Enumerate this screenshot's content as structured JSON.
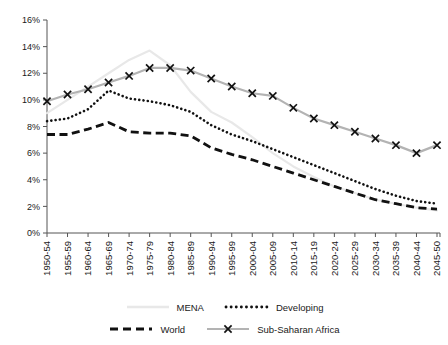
{
  "chart_data": {
    "type": "line",
    "title": "",
    "xlabel": "",
    "ylabel": "",
    "ylim": [
      0,
      16
    ],
    "ytick_step": 2,
    "ytick_labels": [
      "0%",
      "2%",
      "4%",
      "6%",
      "8%",
      "10%",
      "12%",
      "14%",
      "16%"
    ],
    "grid": false,
    "legend_position": "bottom",
    "categories": [
      "1950-54",
      "1955-59",
      "1960-64",
      "1965-69",
      "1970-74",
      "1975-79",
      "1980-84",
      "1985-89",
      "1990-94",
      "1995-99",
      "2000-04",
      "2005-09",
      "2010-14",
      "2015-19",
      "2020-24",
      "2025-29",
      "2030-34",
      "2035-39",
      "2040-44",
      "2045-50"
    ],
    "series": [
      {
        "name": "MENA",
        "style": "solid-light",
        "color": "#e8e8e8",
        "values": [
          9.0,
          10.0,
          11.0,
          12.0,
          13.0,
          13.7,
          12.6,
          10.6,
          9.1,
          8.3,
          7.2,
          6.0,
          5.0,
          4.2,
          3.5,
          3.0,
          2.5,
          2.2,
          1.9,
          1.7
        ]
      },
      {
        "name": "Developing",
        "style": "dotted",
        "color": "#111111",
        "values": [
          8.4,
          8.6,
          9.3,
          10.7,
          10.1,
          9.9,
          9.6,
          9.1,
          8.1,
          7.4,
          6.9,
          6.3,
          5.7,
          5.1,
          4.5,
          3.9,
          3.3,
          2.8,
          2.4,
          2.2
        ]
      },
      {
        "name": "World",
        "style": "dashed",
        "color": "#111111",
        "values": [
          7.4,
          7.4,
          7.8,
          8.3,
          7.6,
          7.5,
          7.5,
          7.3,
          6.4,
          5.9,
          5.5,
          5.0,
          4.5,
          4.0,
          3.5,
          3.0,
          2.5,
          2.2,
          1.9,
          1.8
        ]
      },
      {
        "name": "Sub-Saharan Africa",
        "style": "marker-x",
        "color": "#b3b3b3",
        "marker_color": "#111111",
        "values": [
          9.9,
          10.4,
          10.8,
          11.3,
          11.8,
          12.4,
          12.4,
          12.2,
          11.6,
          11.0,
          10.5,
          10.3,
          9.4,
          8.6,
          8.1,
          7.6,
          7.1,
          6.6,
          6.0,
          6.6
        ]
      }
    ]
  },
  "legend": {
    "items": [
      {
        "label": "MENA",
        "style": "solid-light"
      },
      {
        "label": "Developing",
        "style": "dotted"
      },
      {
        "label": "World",
        "style": "dashed"
      },
      {
        "label": "Sub-Saharan Africa",
        "style": "marker-x"
      }
    ]
  }
}
